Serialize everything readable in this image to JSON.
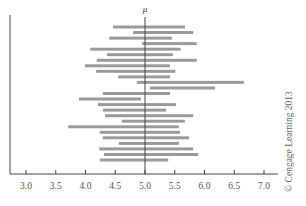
{
  "chart_data": {
    "type": "interval",
    "title": "",
    "xlabel": "",
    "ylabel": "",
    "xlim": [
      2.75,
      7.25
    ],
    "x_ticks": [
      3.0,
      3.5,
      4.0,
      4.5,
      5.0,
      5.5,
      6.0,
      6.5,
      7.0
    ],
    "x_tick_labels": [
      "3.0",
      "3.5",
      "4.0",
      "4.5",
      "5.0",
      "5.5",
      "6.0",
      "6.5",
      "7.0"
    ],
    "reference_line": {
      "label": "μ",
      "value": 5.0
    },
    "grid": false,
    "legend": null,
    "intervals": [
      {
        "low": 4.46,
        "high": 5.67
      },
      {
        "low": 4.8,
        "high": 5.81
      },
      {
        "low": 4.4,
        "high": 5.45
      },
      {
        "low": 4.95,
        "high": 5.87
      },
      {
        "low": 4.08,
        "high": 5.6
      },
      {
        "low": 4.36,
        "high": 5.47
      },
      {
        "low": 4.19,
        "high": 5.87
      },
      {
        "low": 3.99,
        "high": 5.42
      },
      {
        "low": 4.18,
        "high": 5.51
      },
      {
        "low": 4.55,
        "high": 5.42
      },
      {
        "low": 4.86,
        "high": 6.66
      },
      {
        "low": 5.08,
        "high": 6.18
      },
      {
        "low": 4.29,
        "high": 5.42
      },
      {
        "low": 3.89,
        "high": 4.93
      },
      {
        "low": 4.21,
        "high": 5.52
      },
      {
        "low": 4.29,
        "high": 5.35
      },
      {
        "low": 4.33,
        "high": 5.81
      },
      {
        "low": 4.61,
        "high": 5.67
      },
      {
        "low": 3.71,
        "high": 5.57
      },
      {
        "low": 4.24,
        "high": 5.59
      },
      {
        "low": 4.29,
        "high": 5.74
      },
      {
        "low": 4.56,
        "high": 5.57
      },
      {
        "low": 4.23,
        "high": 5.81
      },
      {
        "low": 4.31,
        "high": 5.89
      },
      {
        "low": 4.24,
        "high": 5.39
      }
    ],
    "annotations": [
      "© Cengage Learning 2013"
    ]
  },
  "labels": {
    "mu": "μ",
    "credit": "© Cengage Learning 2013",
    "ticks": [
      "3.0",
      "3.5",
      "4.0",
      "4.5",
      "5.0",
      "5.5",
      "6.0",
      "6.5",
      "7.0"
    ]
  },
  "colors": {
    "bar": "#9a9a9a",
    "axis": "#444444",
    "mu_line": "#444444"
  }
}
